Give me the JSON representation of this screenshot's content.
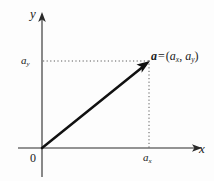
{
  "figure": {
    "background_color": "#fdfdfd",
    "stroke_color": "#1a1a1a"
  },
  "axes": {
    "x_axis": {
      "label": "x",
      "name": "x-axis",
      "start": [
        18,
        148
      ],
      "end": [
        200,
        148
      ],
      "arrow": "right"
    },
    "y_axis": {
      "label": "y",
      "name": "y-axis",
      "start": [
        42,
        176
      ],
      "end": [
        42,
        14
      ],
      "arrow": "up"
    },
    "origin_label": "0"
  },
  "ticks": {
    "x_component": {
      "base": "a",
      "subscript": "x",
      "position": [
        149,
        148
      ]
    },
    "y_component": {
      "base": "a",
      "subscript": "y",
      "position": [
        42,
        61
      ]
    }
  },
  "vector": {
    "name": "vector-a",
    "tail": [
      42,
      148
    ],
    "head": [
      149,
      62
    ],
    "stroke_width": 2.4,
    "arrowhead": true,
    "label": {
      "symbol": "a",
      "equals": "=",
      "open_paren": "(",
      "comp_x_base": "a",
      "comp_x_sub": "x",
      "comma": ",",
      "comp_y_base": "a",
      "comp_y_sub": "y",
      "close_paren": ")"
    }
  },
  "guides": {
    "horizontal_dotted": {
      "name": "horizontal-guide",
      "from": [
        42,
        61
      ],
      "to": [
        150,
        61
      ],
      "style": "dotted"
    },
    "vertical_dotted": {
      "name": "vertical-guide",
      "from": [
        149,
        62
      ],
      "to": [
        149,
        148
      ],
      "style": "dotted"
    }
  }
}
